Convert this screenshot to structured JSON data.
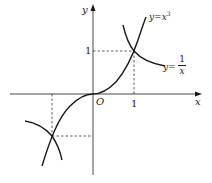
{
  "diagram": {
    "type": "function-graph",
    "axes": {
      "x_label": "x",
      "y_label": "y",
      "origin_label": "O",
      "x_tick_label": "1",
      "y_tick_label": "1"
    },
    "curves": [
      {
        "name": "cubic",
        "label": "y= x³",
        "label_prefix": "y=",
        "label_expr": "x",
        "label_sup": "3"
      },
      {
        "name": "reciprocal",
        "label_prefix": "y=",
        "numerator": "1",
        "denominator": "x"
      }
    ],
    "intersections": [
      {
        "x": 1,
        "y": 1
      },
      {
        "x": -1,
        "y": -1
      }
    ],
    "colors": {
      "stroke": "#1a1a1a",
      "background": "#ffffff"
    }
  }
}
